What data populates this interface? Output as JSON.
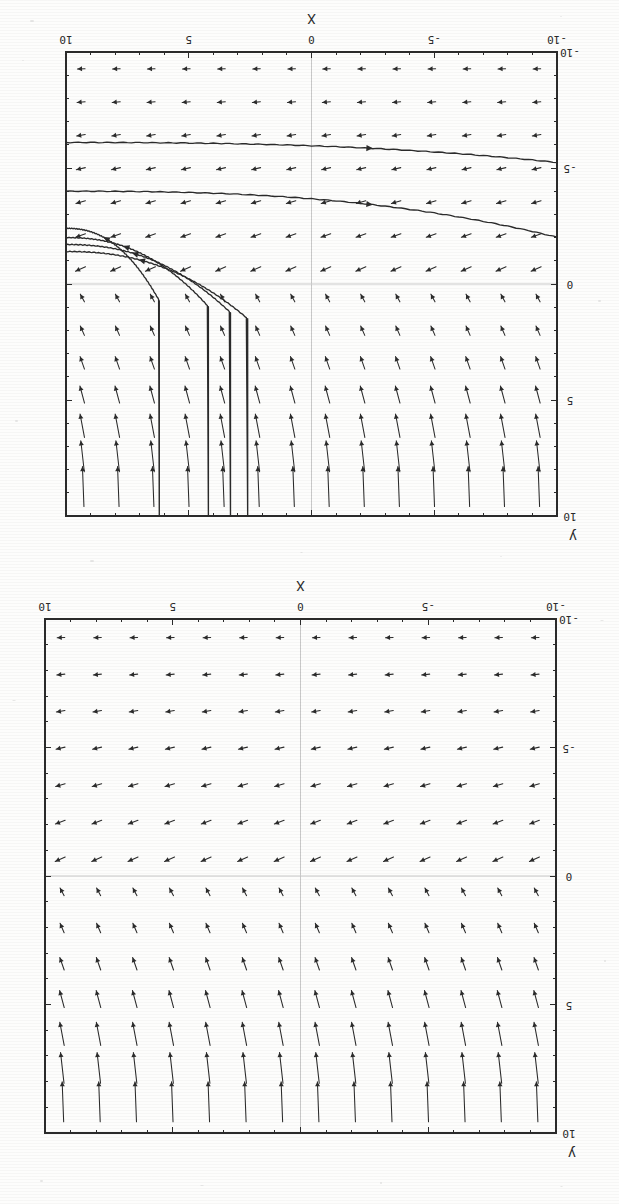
{
  "document": {
    "kind": "scanned-figure-page",
    "orientation_note": "upside-down",
    "background_color": "#fdfdfc",
    "ink_color": "#2b2b2b",
    "axis_zero_line_color": "#c9c9c9"
  },
  "figures": [
    {
      "id": "top",
      "name": "direction-field-with-solution-curves",
      "axis_label_x": "X",
      "axis_label_y": "y",
      "x_ticks": [
        "10",
        "5",
        "0",
        "-5",
        "-10"
      ],
      "y_ticks": [
        "-10",
        "-5",
        "0",
        "5",
        "10"
      ],
      "has_solution_curves": true
    },
    {
      "id": "bottom",
      "name": "direction-field-plain",
      "axis_label_x": "X",
      "axis_label_y": "y",
      "x_ticks": [
        "10",
        "5",
        "0",
        "-5",
        "-10"
      ],
      "y_ticks": [
        "-10",
        "-5",
        "0",
        "5",
        "10"
      ],
      "has_solution_curves": false
    }
  ],
  "chart_data": [
    {
      "type": "scatter",
      "subtype": "direction-field",
      "title": "",
      "xlabel": "X",
      "ylabel": "y",
      "xlim": [
        10,
        -10
      ],
      "ylim": [
        -10,
        10
      ],
      "x_tick_values": [
        10,
        5,
        0,
        -5,
        -10
      ],
      "x_tick_labels": [
        "10",
        "5",
        "0",
        "-5",
        "-10"
      ],
      "y_tick_values": [
        -10,
        -5,
        0,
        5,
        10
      ],
      "y_tick_labels": [
        "-10",
        "-5",
        "0",
        "5",
        "10"
      ],
      "minor_tick_step": 1,
      "grid": false,
      "zero_lines": true,
      "legend": "none",
      "field_grid_cols": 14,
      "field_grid_rows": 14,
      "field_x_samples": [
        -9.28,
        -7.85,
        -6.43,
        -5.0,
        -3.57,
        -2.14,
        -0.71,
        0.71,
        2.14,
        3.57,
        5.0,
        6.43,
        7.85,
        9.28
      ],
      "field_y_samples": [
        -9.28,
        -7.85,
        -6.43,
        -5.0,
        -3.57,
        -2.14,
        -0.71,
        0.71,
        2.14,
        3.57,
        5.0,
        6.43,
        7.85,
        9.28
      ],
      "field_rule": "arrow length grows with |y|; direction is left (-x) for y<0 and up (+y) for y>0; rotated 180 degrees on the page",
      "solution_curves": [
        {
          "name": "curve-1",
          "asymptote_y": -6.1,
          "vertical_x": null
        },
        {
          "name": "curve-2",
          "asymptote_y": -4.0,
          "vertical_x": null
        },
        {
          "name": "curve-3",
          "asymptote_y": -2.4,
          "vertical_x": 6.2
        },
        {
          "name": "curve-4",
          "asymptote_y": -2.0,
          "vertical_x": 4.2
        },
        {
          "name": "curve-5",
          "asymptote_y": -1.7,
          "vertical_x": 3.3
        },
        {
          "name": "curve-6",
          "asymptote_y": -1.4,
          "vertical_x": 2.6
        }
      ]
    },
    {
      "type": "scatter",
      "subtype": "direction-field",
      "title": "",
      "xlabel": "X",
      "ylabel": "y",
      "xlim": [
        10,
        -10
      ],
      "ylim": [
        -10,
        10
      ],
      "x_tick_values": [
        10,
        5,
        0,
        -5,
        -10
      ],
      "x_tick_labels": [
        "10",
        "5",
        "0",
        "-5",
        "-10"
      ],
      "y_tick_values": [
        -10,
        -5,
        0,
        5,
        10
      ],
      "y_tick_labels": [
        "-10",
        "-5",
        "0",
        "5",
        "10"
      ],
      "minor_tick_step": 1,
      "grid": false,
      "zero_lines": true,
      "legend": "none",
      "field_grid_cols": 14,
      "field_grid_rows": 14,
      "field_x_samples": [
        -9.28,
        -7.85,
        -6.43,
        -5.0,
        -3.57,
        -2.14,
        -0.71,
        0.71,
        2.14,
        3.57,
        5.0,
        6.43,
        7.85,
        9.28
      ],
      "field_y_samples": [
        -9.28,
        -7.85,
        -6.43,
        -5.0,
        -3.57,
        -2.14,
        -0.71,
        0.71,
        2.14,
        3.57,
        5.0,
        6.43,
        7.85,
        9.28
      ],
      "field_rule": "arrow length grows with |y|; direction is left (-x) for y<0 and up (+y) for y>0; rotated 180 degrees on the page",
      "solution_curves": []
    }
  ]
}
